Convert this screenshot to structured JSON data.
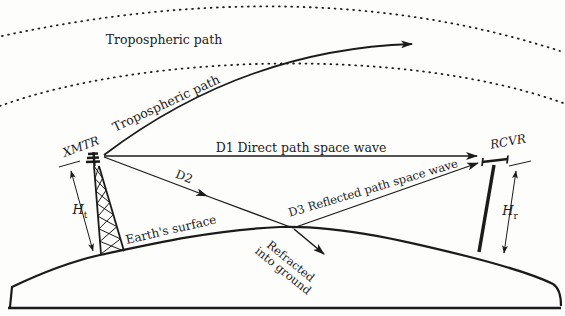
{
  "figure": {
    "type": "radio-wave-propagation-diagram",
    "colors": {
      "ink": "#1b1b1b",
      "background": "#fdfdfc"
    },
    "labels": {
      "tropospheric_path_upper": "Tropospheric path",
      "tropospheric_path_curve": "Tropospheric path",
      "transmitter": "XMTR",
      "receiver": "RCVR",
      "direct_path": "D1 Direct path space wave",
      "incident_path": "D2",
      "reflected_path": "D3 Reflected path space wave",
      "earth_surface": "Earth's surface",
      "refracted_line1": "Refracted",
      "refracted_line2": "into ground",
      "transmitter_height_symbol": "H",
      "transmitter_height_sub": "t",
      "receiver_height_symbol": "H",
      "receiver_height_sub": "r"
    }
  }
}
